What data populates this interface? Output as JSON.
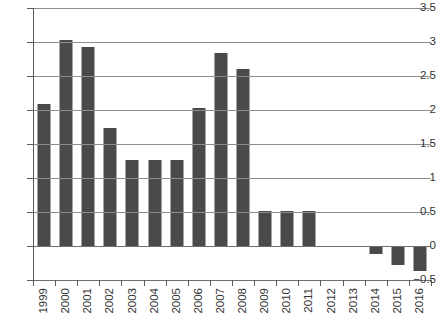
{
  "chart_data": {
    "type": "bar",
    "title": "",
    "subtitle": "",
    "xlabel": "",
    "ylabel": "",
    "categories": [
      "1999",
      "2000",
      "2001",
      "2002",
      "2003",
      "2004",
      "2005",
      "2006",
      "2007",
      "2008",
      "2009",
      "2010",
      "2011",
      "2012",
      "2013",
      "2014",
      "2015",
      "2016"
    ],
    "values": [
      2.09,
      3.03,
      2.93,
      1.74,
      1.27,
      1.27,
      1.27,
      2.03,
      2.84,
      2.6,
      0.52,
      0.52,
      0.52,
      0,
      0,
      -0.12,
      -0.28,
      -0.37
    ],
    "series": [
      {
        "name": "",
        "values": [
          2.09,
          3.03,
          2.93,
          1.74,
          1.27,
          1.27,
          1.27,
          2.03,
          2.84,
          2.6,
          0.52,
          0.52,
          0.52,
          0,
          0,
          -0.12,
          -0.28,
          -0.37
        ]
      }
    ],
    "ylim": [
      -0.5,
      3.5
    ],
    "ytick_labels": [
      "3.5",
      "3",
      "2.5",
      "2",
      "1.5",
      "1",
      "0.5",
      "0",
      "−0.5"
    ],
    "ytick_values": [
      3.5,
      3,
      2.5,
      2,
      1.5,
      1,
      0.5,
      0,
      -0.5
    ],
    "grid": true,
    "grid_axis": "y",
    "legend": false,
    "legend_position": "none",
    "bar_color": "#4a4a4a",
    "grid_color": "#8d8d8d",
    "axis_color": "#5a5a5a",
    "background_color": "#ffffff",
    "xtick_label_rotation": 90,
    "annotations": []
  }
}
